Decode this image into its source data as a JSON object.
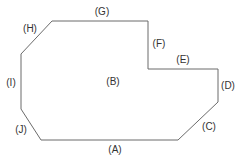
{
  "diagram": {
    "type": "floor-plan-outline",
    "stroke_color": "#6b6b6b",
    "label_color": "#333333",
    "background": "#ffffff",
    "labels": {
      "A": "(A)",
      "B": "(B)",
      "C": "(C)",
      "D": "(D)",
      "E": "(E)",
      "F": "(F)",
      "G": "(G)",
      "H": "(H)",
      "I": "(I)",
      "J": "(J)"
    },
    "edges": [
      {
        "id": "A",
        "side": "bottom"
      },
      {
        "id": "C",
        "side": "bottom-right diagonal"
      },
      {
        "id": "D",
        "side": "right"
      },
      {
        "id": "E",
        "side": "inner top step"
      },
      {
        "id": "F",
        "side": "inner vertical step"
      },
      {
        "id": "G",
        "side": "top"
      },
      {
        "id": "H",
        "side": "top-left diagonal"
      },
      {
        "id": "I",
        "side": "left"
      },
      {
        "id": "J",
        "side": "bottom-left diagonal"
      }
    ],
    "interior_label": "B"
  }
}
